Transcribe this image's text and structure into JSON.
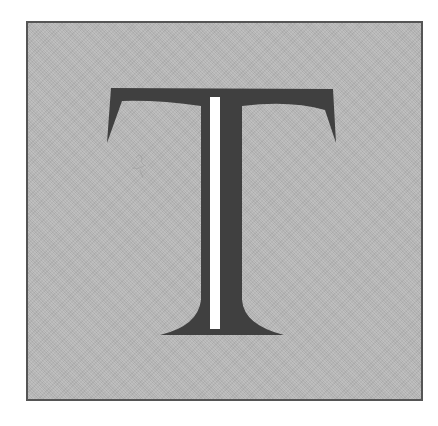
{
  "drop_cap": {
    "letter": "T",
    "alt_label": "Decorative drop-cap letter T"
  },
  "colors": {
    "background": "#ffffff",
    "frame_fill": "#b7b7b7",
    "frame_border": "#555555",
    "letter_fill": "#404040",
    "highlight_stripe": "#ffffff",
    "smudge": "#9a9a9a"
  }
}
